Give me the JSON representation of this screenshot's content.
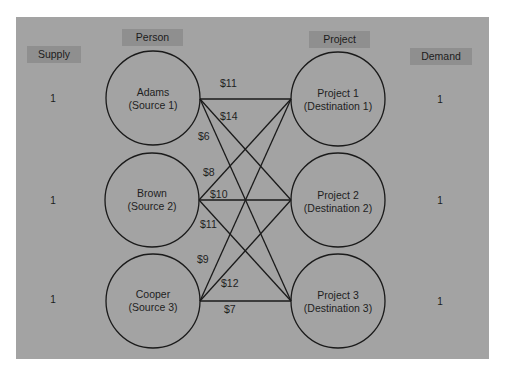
{
  "headers": {
    "supply": "Supply",
    "person": "Person",
    "project": "Project",
    "demand": "Demand"
  },
  "sources": [
    {
      "name": "Adams",
      "role": "(Source 1)",
      "supply": "1"
    },
    {
      "name": "Brown",
      "role": "(Source 2)",
      "supply": "1"
    },
    {
      "name": "Cooper",
      "role": "(Source 3)",
      "supply": "1"
    }
  ],
  "destinations": [
    {
      "name": "Project 1",
      "role": "(Destination 1)",
      "demand": "1"
    },
    {
      "name": "Project 2",
      "role": "(Destination 2)",
      "demand": "1"
    },
    {
      "name": "Project 3",
      "role": "(Destination 3)",
      "demand": "1"
    }
  ],
  "costs": {
    "adams_p1": "$11",
    "adams_p2": "$14",
    "adams_p3": "$6",
    "brown_p1": "$8",
    "brown_p2": "$10",
    "brown_p3": "$11",
    "cooper_p1": "$9",
    "cooper_p2": "$12",
    "cooper_p3": "$7"
  },
  "colors": {
    "panel": "#a3a3a3",
    "header_box": "#8f8f8f",
    "stroke": "#1a1a1a"
  }
}
